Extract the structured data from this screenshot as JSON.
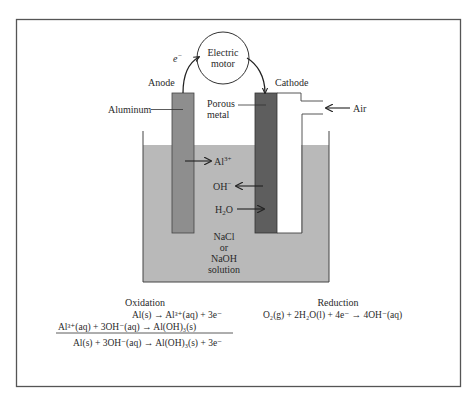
{
  "diagram": {
    "type": "aluminum-air battery cell",
    "colors": {
      "frame": "#555555",
      "solution": "#b9b9b9",
      "anode": "#8e8e8e",
      "cathode": "#5e5e5e",
      "air_compartment": "#ffffff",
      "line": "#333333"
    },
    "labels": {
      "electron": "e",
      "electron_sup": "−",
      "motor_line1": "Electric",
      "motor_line2": "motor",
      "anode": "Anode",
      "cathode": "Cathode",
      "aluminum": "Aluminum",
      "porous_line1": "Porous",
      "porous_line2": "metal",
      "air": "Air",
      "al_ion": "Al",
      "al_ion_sup": "3+",
      "hydroxide": "OH",
      "hydroxide_sup": "−",
      "water": "H",
      "water_sub": "2",
      "water_end": "O",
      "solution_line1": "NaCl",
      "solution_line2": "or",
      "solution_line3": "NaOH",
      "solution_line4": "solution"
    },
    "oxidation": {
      "title": "Oxidation",
      "eq1": "Al(s) → Al³⁺(aq) + 3e⁻",
      "eq2": "Al³⁺(aq) + 3OH⁻(aq) → Al(OH)₃(s)",
      "net": "Al(s) + 3OH⁻(aq) → Al(OH)₃(s) + 3e⁻"
    },
    "reduction": {
      "title": "Reduction",
      "eq1": "O₂(g) + 2H₂O(l) + 4e⁻ → 4OH⁻(aq)"
    }
  }
}
